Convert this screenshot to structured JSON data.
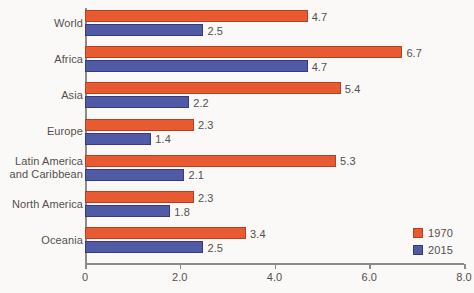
{
  "chart_data": {
    "type": "bar",
    "orientation": "horizontal",
    "title": "",
    "xlabel": "",
    "ylabel": "",
    "categories": [
      "World",
      "Africa",
      "Asia",
      "Europe",
      "Latin America\nand Caribbean",
      "North America",
      "Oceania"
    ],
    "series": [
      {
        "name": "1970",
        "color": "#e85a31",
        "values": [
          4.7,
          6.7,
          5.4,
          2.3,
          5.3,
          2.3,
          3.4
        ],
        "labels": [
          "4.7",
          "6.7",
          "5.4",
          "2.3",
          "5.3",
          "2.3",
          "3.4"
        ]
      },
      {
        "name": "2015",
        "color": "#515aa4",
        "values": [
          2.5,
          4.7,
          2.2,
          1.4,
          2.1,
          1.8,
          2.5
        ],
        "labels": [
          "2.5",
          "4.7",
          "2.2",
          "1.4",
          "2.1",
          "1.8",
          "2.5"
        ]
      }
    ],
    "xlim": [
      0,
      8.0
    ],
    "xticks": [
      0,
      2.0,
      4.0,
      6.0,
      8.0
    ],
    "xtick_labels": [
      "0",
      "2.0",
      "4.0",
      "6.0",
      "8.0"
    ],
    "grid": false,
    "legend": {
      "position": "bottom-right",
      "entries": [
        {
          "label": "1970",
          "color": "#e85a31"
        },
        {
          "label": "2015",
          "color": "#515aa4"
        }
      ]
    },
    "background_color": "#fbf9f7",
    "axis_color": "#8d8a88",
    "text_color": "#55504e"
  }
}
